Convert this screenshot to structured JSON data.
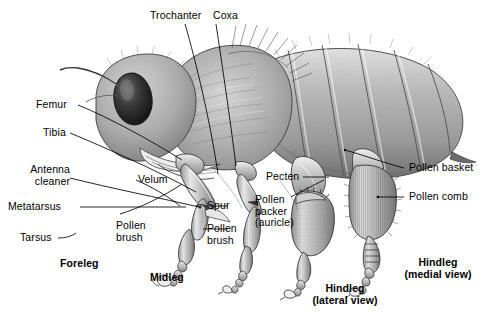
{
  "figure": {
    "background_color": "#ffffff",
    "ink_color": "#000000",
    "style": "graphite pencil scientific illustration"
  },
  "labels": {
    "trochanter": "Trochanter",
    "coxa": "Coxa",
    "femur": "Femur",
    "tibia": "Tibia",
    "antenna_cleaner_l1": "Antenna",
    "antenna_cleaner_l2": "cleaner",
    "metatarsus": "Metatarsus",
    "tarsus": "Tarsus",
    "velum": "Velum",
    "pollen_brush_fore_l1": "Pollen",
    "pollen_brush_fore_l2": "brush",
    "spur": "Spur",
    "pollen_brush_mid_l1": "Pollen",
    "pollen_brush_mid_l2": "brush",
    "pecten": "Pecten",
    "pollen_packer_l1": "Pollen",
    "pollen_packer_l2": "packer",
    "pollen_packer_l3": "(auricle)",
    "pollen_basket": "Pollen basket",
    "pollen_comb": "Pollen comb"
  },
  "captions": {
    "foreleg": "Foreleg",
    "midleg": "Midleg",
    "hindleg_lateral_l1": "Hindleg",
    "hindleg_lateral_l2": "(lateral view)",
    "hindleg_medial_l1": "Hindleg",
    "hindleg_medial_l2": "(medial view)"
  }
}
